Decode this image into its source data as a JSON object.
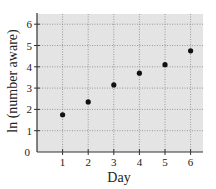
{
  "chart_data": {
    "type": "scatter",
    "title": "",
    "xlabel": "Day",
    "ylabel": "ln (number aware)",
    "x": [
      1,
      2,
      3,
      4,
      5,
      6
    ],
    "series": [
      {
        "name": "ln (number aware)",
        "values": [
          1.75,
          2.35,
          3.15,
          3.7,
          4.1,
          4.75
        ]
      }
    ],
    "xlim": [
      0,
      6.5
    ],
    "ylim": [
      0,
      6.5
    ],
    "xticks": [
      1,
      2,
      3,
      4,
      5,
      6
    ],
    "yticks": [
      0,
      1,
      2,
      3,
      4,
      5,
      6
    ],
    "grid": true,
    "legend": "none"
  },
  "style": {
    "plot_background": "#e4e4e4",
    "grid_color": "#888888",
    "axis_color": "#333333",
    "marker_color": "#111111"
  },
  "labels": {
    "xlabel": "Day",
    "ylabel": "ln (number aware)"
  }
}
